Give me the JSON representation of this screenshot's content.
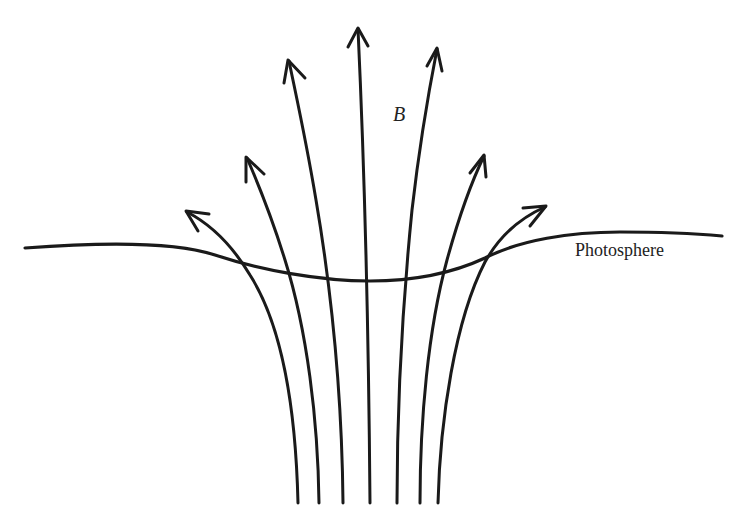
{
  "diagram": {
    "labels": {
      "field": "B",
      "surface": "Photosphere"
    },
    "field_lines": [
      {
        "name": "far-left",
        "bottom": [
          298,
          503
        ],
        "tip": [
          185,
          210
        ]
      },
      {
        "name": "left-2",
        "bottom": [
          319,
          503
        ],
        "tip": [
          246,
          157
        ]
      },
      {
        "name": "left-3",
        "bottom": [
          343,
          503
        ],
        "tip": [
          288,
          60
        ]
      },
      {
        "name": "center",
        "bottom": [
          370,
          503
        ],
        "tip": [
          358,
          28
        ]
      },
      {
        "name": "right-3",
        "bottom": [
          397,
          503
        ],
        "tip": [
          437,
          48
        ]
      },
      {
        "name": "right-2",
        "bottom": [
          420,
          503
        ],
        "tip": [
          484,
          155
        ]
      },
      {
        "name": "far-right",
        "bottom": [
          438,
          503
        ],
        "tip": [
          546,
          206
        ]
      }
    ],
    "colors": {
      "ink": "#1a1a1a",
      "background": "#ffffff"
    }
  }
}
